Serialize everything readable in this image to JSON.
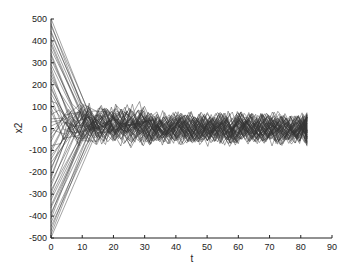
{
  "chart_data": {
    "type": "line",
    "title": "",
    "xlabel": "t",
    "ylabel": "x2",
    "xlim": [
      0,
      90
    ],
    "ylim": [
      -500,
      500
    ],
    "xticks": [
      0,
      10,
      20,
      30,
      40,
      50,
      60,
      70,
      80,
      90
    ],
    "yticks": [
      500,
      400,
      300,
      200,
      100,
      0,
      -100,
      -200,
      -300,
      -400,
      -500
    ],
    "grid": false,
    "legend": null,
    "line_color": "#333333",
    "series_summary": {
      "num_series": 60,
      "initial_range": [
        -500,
        500
      ],
      "convergence_time": 30,
      "steady_band": [
        -60,
        60
      ],
      "t_end": 82
    }
  }
}
